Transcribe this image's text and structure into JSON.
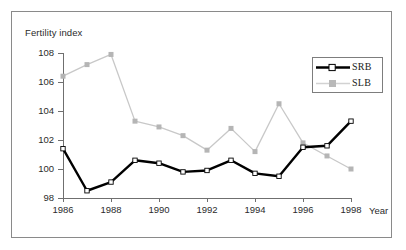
{
  "chart_data": {
    "type": "line",
    "title": "",
    "xlabel": "Year",
    "ylabel": "Fertility index",
    "x": [
      1986,
      1987,
      1988,
      1989,
      1990,
      1991,
      1992,
      1993,
      1994,
      1995,
      1996,
      1997,
      1998
    ],
    "xtick_labels": [
      "1986",
      "1988",
      "1990",
      "1992",
      "1994",
      "1996",
      "1998"
    ],
    "xtick_values": [
      1986,
      1988,
      1990,
      1992,
      1994,
      1996,
      1998
    ],
    "ytick_labels": [
      "98",
      "100",
      "102",
      "104",
      "106",
      "108"
    ],
    "ytick_values": [
      98,
      100,
      102,
      104,
      106,
      108
    ],
    "xlim": [
      1986,
      1998
    ],
    "ylim": [
      98,
      108
    ],
    "grid": false,
    "legend_position": "top-right",
    "series": [
      {
        "name": "SRB",
        "color": "#000000",
        "marker": "square-open",
        "values": [
          101.4,
          98.5,
          99.1,
          100.6,
          100.4,
          99.8,
          99.9,
          100.6,
          99.7,
          99.5,
          101.5,
          101.6,
          103.3
        ]
      },
      {
        "name": "SLB",
        "color": "#c8c8c8",
        "marker": "square-filled",
        "values": [
          106.4,
          107.2,
          107.9,
          103.3,
          102.9,
          102.3,
          101.3,
          102.8,
          101.2,
          104.5,
          101.8,
          100.9,
          100.0
        ]
      }
    ]
  },
  "axis": {
    "y_title": "Fertility index",
    "x_title": "Year"
  },
  "legend": {
    "items": [
      {
        "label": "SRB"
      },
      {
        "label": "SLB"
      }
    ]
  }
}
